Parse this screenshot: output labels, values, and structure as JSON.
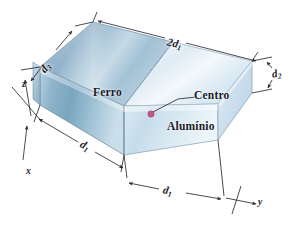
{
  "figure": {
    "type": "3d-rectangular-block-diagram",
    "background_color": "#ffffff"
  },
  "materials": [
    {
      "id": "ferro",
      "label": "Ferro",
      "region": "left-half",
      "top_face_color": "#9dbdd2",
      "front_face_color": "#7ea7c2",
      "description": "metade esquerda do bloco, tom azul-ago mais escuro"
    },
    {
      "id": "aluminio",
      "label": "Alumínio",
      "region": "right-half",
      "top_face_color": "#e4eef6",
      "front_face_color": "#ccdeea",
      "description": "metade direita do bloco, tom azul-claro quase branco"
    }
  ],
  "annotations": {
    "center_point": {
      "label": "Centro",
      "color": "#c4577f",
      "x": 151,
      "y": 114
    },
    "leader_line": {
      "from_x": 153,
      "from_y": 112,
      "bend_x": 178,
      "bend_y": 99,
      "to_x": 196,
      "to_y": 97
    }
  },
  "dimensions": [
    {
      "id": "dim-2d1-top",
      "base": "2d",
      "sub": "1",
      "edge": "aresta superior traseira",
      "position": "top"
    },
    {
      "id": "dim-d3-left",
      "base": "d",
      "sub": "3",
      "edge": "aresta superior esquerda",
      "position": "upper-left"
    },
    {
      "id": "dim-d2-right",
      "base": "d",
      "sub": "2",
      "edge": "altura da face direita",
      "position": "right"
    },
    {
      "id": "dim-d1-left",
      "base": "d",
      "sub": "1",
      "edge": "metade frontal esquerda (ferro)",
      "position": "bottom-left"
    },
    {
      "id": "dim-d1-right",
      "base": "d",
      "sub": "1",
      "edge": "metade frontal direita (aluminio)",
      "position": "bottom-right"
    }
  ],
  "axes": [
    {
      "id": "axis-z",
      "label": "z",
      "direction": "vertical-up"
    },
    {
      "id": "axis-x",
      "label": "x",
      "direction": "down-left-front"
    },
    {
      "id": "axis-y",
      "label": "y",
      "direction": "right-front"
    }
  ],
  "colors": {
    "edge_stroke": "#5f7e93",
    "dim_line": "#2b2b33",
    "center_dot": "#c4577f",
    "text": "#1a1a28"
  }
}
